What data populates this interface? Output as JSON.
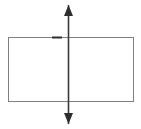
{
  "figure": {
    "canvas": {
      "width": 141,
      "height": 129,
      "background_color": "#ffffff"
    },
    "shapes": {
      "rectangle": {
        "label": "rectangle",
        "x": 8,
        "y": 37,
        "width": 125,
        "height": 64,
        "stroke_color": "#808080",
        "stroke_width": 1,
        "fill_color": "none"
      },
      "symmetry_axis": {
        "label": "vertical double-headed arrow",
        "x": 68.5,
        "y_top": 5,
        "y_bottom": 124,
        "stroke_color": "#3a3a3a",
        "stroke_width": 1.6
      },
      "arrowhead_top": {
        "label": "up arrowhead",
        "tip_x": 68.5,
        "tip_y": 5,
        "width": 9,
        "height": 11,
        "fill_color": "#2e2e2e"
      },
      "arrowhead_bottom": {
        "label": "down arrowhead",
        "tip_x": 68.5,
        "tip_y": 124,
        "width": 9,
        "height": 11,
        "fill_color": "#2e2e2e"
      },
      "tick_mark": {
        "label": "short dark segment on top edge",
        "x1": 52,
        "x2": 62,
        "y": 37.5,
        "stroke_color": "#2e2e2e",
        "stroke_width": 2
      }
    }
  }
}
